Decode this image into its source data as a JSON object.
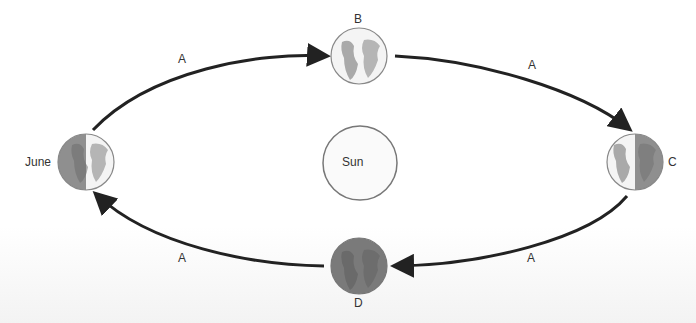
{
  "diagram": {
    "center": {
      "label": "Sun"
    },
    "positions": [
      {
        "id": "june",
        "label": "June",
        "shading": "left-half-dark"
      },
      {
        "id": "b",
        "label": "B",
        "shading": "fully-lit"
      },
      {
        "id": "c",
        "label": "C",
        "shading": "right-half-dark"
      },
      {
        "id": "d",
        "label": "D",
        "shading": "fully-dark"
      }
    ],
    "arrows": [
      {
        "from": "june",
        "to": "b",
        "label": "A"
      },
      {
        "from": "b",
        "to": "c",
        "label": "A"
      },
      {
        "from": "c",
        "to": "d",
        "label": "A"
      },
      {
        "from": "d",
        "to": "june",
        "label": "A"
      }
    ]
  }
}
